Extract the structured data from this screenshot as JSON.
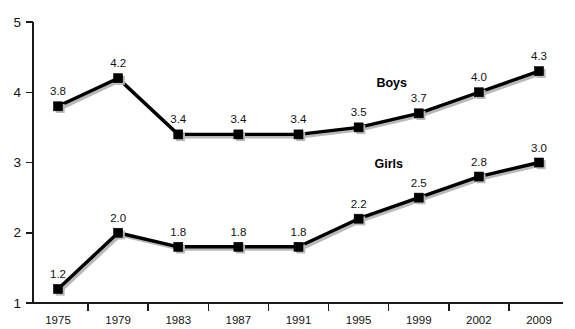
{
  "chart_data": {
    "type": "line",
    "title": "",
    "subtitle": "",
    "xlabel": "",
    "ylabel": "",
    "categories": [
      "1975",
      "1979",
      "1983",
      "1987",
      "1991",
      "1995",
      "1999",
      "2002",
      "2009"
    ],
    "x_tick_labels": [
      "1975",
      "1979",
      "1983",
      "1987",
      "1991",
      "1995",
      "1999",
      "2002",
      "2009"
    ],
    "y_tick_labels": [
      "1",
      "2",
      "3",
      "4",
      "5"
    ],
    "y_tick_values": [
      1,
      2,
      3,
      4,
      5
    ],
    "ylim": [
      1,
      5
    ],
    "grid": false,
    "legend_position": "inline-annotation",
    "series": [
      {
        "name": "Boys",
        "values": [
          3.8,
          4.2,
          3.4,
          3.4,
          3.4,
          3.5,
          3.7,
          4.0,
          4.3
        ],
        "labels": [
          "3.8",
          "4.2",
          "3.4",
          "3.4",
          "3.4",
          "3.5",
          "3.7",
          "4.0",
          "4.3"
        ],
        "color": "#000000",
        "annotation": "Boys"
      },
      {
        "name": "Girls",
        "values": [
          1.2,
          2.0,
          1.8,
          1.8,
          1.8,
          2.2,
          2.5,
          2.8,
          3.0
        ],
        "labels": [
          "1.2",
          "2.0",
          "1.8",
          "1.8",
          "1.8",
          "2.2",
          "2.5",
          "2.8",
          "3.0"
        ],
        "color": "#000000",
        "annotation": "Girls"
      }
    ],
    "colors": {
      "background": "#ffffff",
      "axis": "#1a1a1a",
      "line": "#000000",
      "shadow": "#b9b9b9",
      "text": "#111111"
    }
  }
}
